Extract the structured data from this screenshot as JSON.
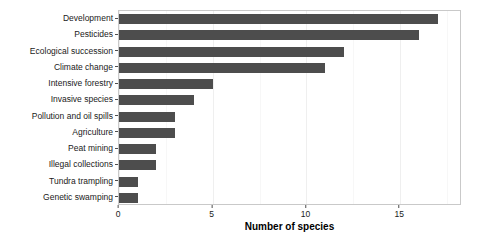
{
  "chart_data": {
    "type": "bar",
    "orientation": "horizontal",
    "title": "",
    "xlabel": "Number of species",
    "ylabel": "",
    "categories": [
      "Development",
      "Pesticides",
      "Ecological succession",
      "Climate change",
      "Intensive forestry",
      "Invasive species",
      "Pollution and oil spills",
      "Agriculture",
      "Peat mining",
      "Illegal collections",
      "Tundra trampling",
      "Genetic swamping"
    ],
    "values": [
      17,
      16,
      12,
      11,
      5,
      4,
      3,
      3,
      2,
      2,
      1,
      1
    ],
    "xlim": [
      0,
      18.3
    ],
    "xticks": [
      0,
      5,
      10,
      15
    ],
    "xticklabels": [
      "0",
      "5",
      "10",
      "15"
    ],
    "grid": true,
    "legend": null,
    "bar_color": "#4d4d4d",
    "panel_border_color": "#c9c9c9",
    "gridline_color": "#efefef",
    "background": "#ffffff"
  }
}
